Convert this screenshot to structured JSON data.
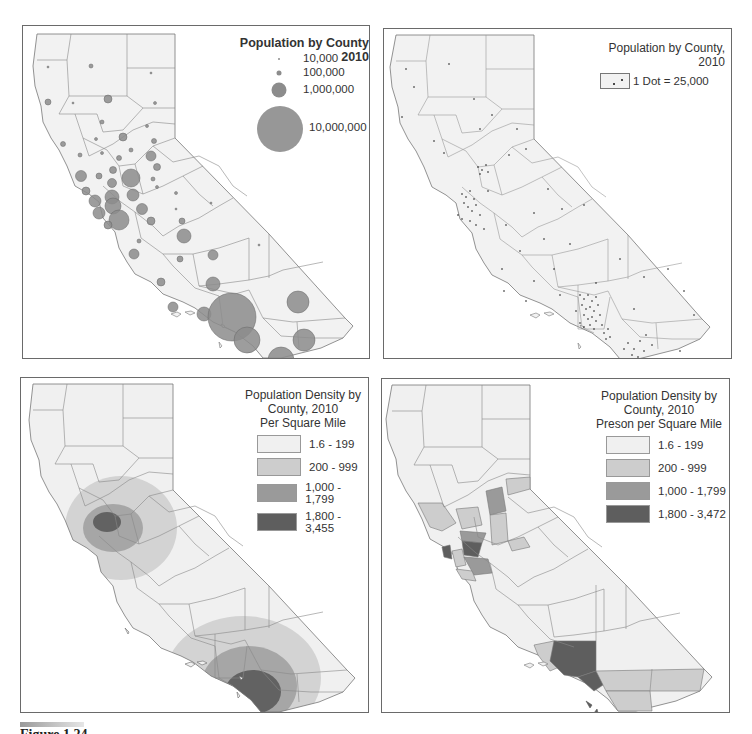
{
  "figure": {
    "caption": "Figure 1.24"
  },
  "panels": {
    "proportional_symbol": {
      "title": "Population by County 2010",
      "legend": [
        {
          "label": "10,000",
          "radius": 1
        },
        {
          "label": "100,000",
          "radius": 3
        },
        {
          "label": "1,000,000",
          "radius": 8
        },
        {
          "label": "10,000,000",
          "radius": 23
        }
      ],
      "symbol_color": "#8c8c8c"
    },
    "dot_density": {
      "title": "Population by County, 2010",
      "legend_label": "1 Dot = 25,000"
    },
    "isopleth": {
      "title_line1": "Population Density by",
      "title_line2": "County, 2010",
      "title_line3": "Per Square Mile",
      "classes": [
        {
          "label": "1.6 - 199",
          "color": "#f0f0f0"
        },
        {
          "label": "200 - 999",
          "color": "#cdcdcd"
        },
        {
          "label": "1,000 - 1,799",
          "color": "#9a9a9a"
        },
        {
          "label": "1,800 - 3,455",
          "color": "#5e5e5e"
        }
      ]
    },
    "choropleth": {
      "title_line1": "Population Density by",
      "title_line2": "County, 2010",
      "title_line3": "Preson per Square Mile",
      "classes": [
        {
          "label": "1.6 - 199",
          "color": "#f0f0f0"
        },
        {
          "label": "200 - 999",
          "color": "#cdcdcd"
        },
        {
          "label": "1,000 - 1,799",
          "color": "#9a9a9a"
        },
        {
          "label": "1,800 - 3,472",
          "color": "#5e5e5e"
        }
      ]
    }
  },
  "colors": {
    "land": "#f2f2f2",
    "county_border": "#7a7a7a",
    "panel_border": "#6a6a6a"
  }
}
